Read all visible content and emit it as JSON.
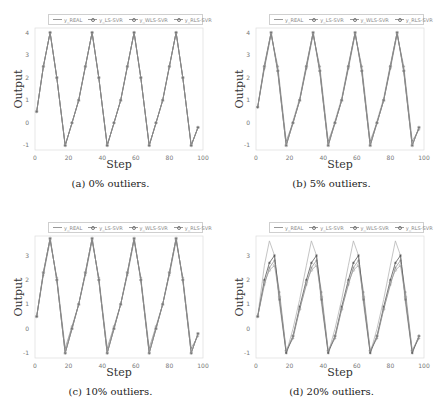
{
  "figure": {
    "panels": [
      {
        "id": "a",
        "caption": "(a) 0% outliers.",
        "xlabel": "Step",
        "ylabel": "Output",
        "yticks": [
          "4",
          "3",
          "2",
          "1",
          "0",
          "-1"
        ],
        "xticks": [
          "0",
          "20",
          "40",
          "60",
          "80",
          "100"
        ]
      },
      {
        "id": "b",
        "caption": "(b) 5% outliers.",
        "xlabel": "Step",
        "ylabel": "Output",
        "yticks": [
          "4",
          "3",
          "2",
          "1",
          "0",
          "-1"
        ],
        "xticks": [
          "0",
          "20",
          "40",
          "60",
          "80",
          "100"
        ]
      },
      {
        "id": "c",
        "caption": "(c) 10% outliers.",
        "xlabel": "Step",
        "ylabel": "Output",
        "yticks": [
          "3",
          "2",
          "1",
          "0",
          "-1"
        ],
        "xticks": [
          "0",
          "20",
          "40",
          "60",
          "80",
          "100"
        ]
      },
      {
        "id": "d",
        "caption": "(d) 20% outliers.",
        "xlabel": "Step",
        "ylabel": "Output",
        "yticks": [
          "3",
          "2",
          "1",
          "0",
          "-1"
        ],
        "xticks": [
          "0",
          "20",
          "40",
          "60",
          "80",
          "100"
        ]
      }
    ],
    "legend": [
      "y_REAL",
      "y_LS-SVR",
      "y_WLS-SVR",
      "y_RLS-SVR"
    ]
  },
  "chart_data": [
    {
      "type": "line",
      "title": "(a) 0% outliers.",
      "xlabel": "Step",
      "ylabel": "Output",
      "xlim": [
        0,
        100
      ],
      "ylim": [
        -1.2,
        4.2
      ],
      "legend": [
        "y_REAL",
        "y_LS-SVR",
        "y_WLS-SVR",
        "y_RLS-SVR"
      ],
      "x": [
        1,
        5,
        9,
        13,
        18,
        22,
        26,
        30,
        34,
        38,
        43,
        47,
        51,
        55,
        59,
        63,
        68,
        72,
        76,
        80,
        84,
        88,
        93,
        97
      ],
      "series": [
        {
          "name": "y_REAL",
          "values": [
            0.5,
            2.5,
            4.0,
            2.0,
            -1.0,
            0.0,
            1.0,
            2.5,
            4.0,
            2.0,
            -1.0,
            0.0,
            1.0,
            2.5,
            4.0,
            2.0,
            -1.0,
            0.0,
            1.0,
            2.5,
            4.0,
            2.0,
            -1.0,
            -0.2
          ]
        },
        {
          "name": "y_LS-SVR",
          "values": [
            0.5,
            2.5,
            4.0,
            2.0,
            -1.0,
            0.0,
            1.0,
            2.5,
            4.0,
            2.0,
            -1.0,
            0.0,
            1.0,
            2.5,
            4.0,
            2.0,
            -1.0,
            0.0,
            1.0,
            2.5,
            4.0,
            2.0,
            -1.0,
            -0.2
          ]
        },
        {
          "name": "y_WLS-SVR",
          "values": [
            0.5,
            2.5,
            4.0,
            2.0,
            -1.0,
            0.0,
            1.0,
            2.5,
            4.0,
            2.0,
            -1.0,
            0.0,
            1.0,
            2.5,
            4.0,
            2.0,
            -1.0,
            0.0,
            1.0,
            2.5,
            4.0,
            2.0,
            -1.0,
            -0.2
          ]
        },
        {
          "name": "y_RLS-SVR",
          "values": [
            0.5,
            2.5,
            4.0,
            2.0,
            -1.0,
            0.0,
            1.0,
            2.5,
            4.0,
            2.0,
            -1.0,
            0.0,
            1.0,
            2.5,
            4.0,
            2.0,
            -1.0,
            0.0,
            1.0,
            2.5,
            4.0,
            2.0,
            -1.0,
            -0.2
          ]
        }
      ]
    },
    {
      "type": "line",
      "title": "(b) 5% outliers.",
      "xlabel": "Step",
      "ylabel": "Output",
      "xlim": [
        0,
        100
      ],
      "ylim": [
        -1.2,
        4.2
      ],
      "legend": [
        "y_REAL",
        "y_LS-SVR",
        "y_WLS-SVR",
        "y_RLS-SVR"
      ],
      "x": [
        1,
        5,
        9,
        13,
        18,
        22,
        26,
        30,
        34,
        38,
        43,
        47,
        51,
        55,
        59,
        63,
        68,
        72,
        76,
        80,
        84,
        88,
        93,
        97
      ],
      "series": [
        {
          "name": "y_REAL",
          "values": [
            0.7,
            2.6,
            4.0,
            2.2,
            -1.0,
            0.1,
            1.1,
            2.6,
            4.0,
            2.2,
            -1.0,
            0.1,
            1.1,
            2.6,
            4.0,
            2.2,
            -1.0,
            0.1,
            1.1,
            2.6,
            4.0,
            2.2,
            -1.0,
            -0.2
          ]
        },
        {
          "name": "y_LS-SVR",
          "values": [
            0.7,
            2.4,
            3.9,
            2.5,
            -0.8,
            0.0,
            1.0,
            2.4,
            3.9,
            2.5,
            -0.8,
            0.0,
            1.0,
            2.4,
            3.9,
            2.5,
            -0.8,
            0.0,
            1.0,
            2.4,
            3.9,
            2.5,
            -0.8,
            -0.3
          ]
        },
        {
          "name": "y_WLS-SVR",
          "values": [
            0.7,
            2.5,
            4.0,
            2.3,
            -1.0,
            0.0,
            1.0,
            2.5,
            4.0,
            2.3,
            -1.0,
            0.0,
            1.0,
            2.5,
            4.0,
            2.3,
            -1.0,
            0.0,
            1.0,
            2.5,
            4.0,
            2.3,
            -1.0,
            -0.2
          ]
        },
        {
          "name": "y_RLS-SVR",
          "values": [
            0.7,
            2.5,
            4.0,
            2.3,
            -1.0,
            0.0,
            1.0,
            2.5,
            4.0,
            2.3,
            -1.0,
            0.0,
            1.0,
            2.5,
            4.0,
            2.3,
            -1.0,
            0.0,
            1.0,
            2.5,
            4.0,
            2.3,
            -1.0,
            -0.2
          ]
        }
      ]
    },
    {
      "type": "line",
      "title": "(c) 10% outliers.",
      "xlabel": "Step",
      "ylabel": "Output",
      "xlim": [
        0,
        100
      ],
      "ylim": [
        -1.2,
        3.8
      ],
      "legend": [
        "y_REAL",
        "y_LS-SVR",
        "y_WLS-SVR",
        "y_RLS-SVR"
      ],
      "x": [
        1,
        5,
        9,
        13,
        18,
        22,
        26,
        30,
        34,
        38,
        43,
        47,
        51,
        55,
        59,
        63,
        68,
        72,
        76,
        80,
        84,
        88,
        93,
        97
      ],
      "series": [
        {
          "name": "y_REAL",
          "values": [
            0.5,
            2.3,
            3.7,
            2.0,
            -1.0,
            0.0,
            1.0,
            2.3,
            3.7,
            2.0,
            -1.0,
            0.0,
            1.0,
            2.3,
            3.7,
            2.0,
            -1.0,
            0.0,
            1.0,
            2.3,
            3.7,
            2.0,
            -1.0,
            -0.2
          ]
        },
        {
          "name": "y_LS-SVR",
          "values": [
            0.5,
            2.2,
            3.6,
            2.1,
            -0.8,
            0.1,
            1.0,
            2.2,
            3.6,
            2.1,
            -0.8,
            0.1,
            1.0,
            2.2,
            3.6,
            2.1,
            -0.8,
            0.1,
            1.0,
            2.2,
            3.6,
            2.1,
            -0.8,
            -0.3
          ]
        },
        {
          "name": "y_WLS-SVR",
          "values": [
            0.5,
            2.3,
            3.7,
            2.0,
            -1.0,
            0.0,
            1.0,
            2.3,
            3.7,
            2.0,
            -1.0,
            0.0,
            1.0,
            2.3,
            3.7,
            2.0,
            -1.0,
            0.0,
            1.0,
            2.3,
            3.7,
            2.0,
            -1.0,
            -0.2
          ]
        },
        {
          "name": "y_RLS-SVR",
          "values": [
            0.5,
            2.3,
            3.7,
            2.0,
            -1.0,
            0.0,
            1.0,
            2.3,
            3.7,
            2.0,
            -1.0,
            0.0,
            1.0,
            2.3,
            3.7,
            2.0,
            -1.0,
            0.0,
            1.0,
            2.3,
            3.7,
            2.0,
            -1.0,
            -0.2
          ]
        }
      ]
    },
    {
      "type": "line",
      "title": "(d) 20% outliers.",
      "xlabel": "Step",
      "ylabel": "Output",
      "xlim": [
        0,
        100
      ],
      "ylim": [
        -1.2,
        3.8
      ],
      "legend": [
        "y_REAL",
        "y_LS-SVR",
        "y_WLS-SVR",
        "y_RLS-SVR"
      ],
      "x": [
        1,
        5,
        8,
        11,
        14,
        18,
        22,
        26,
        30,
        33,
        36,
        39,
        43,
        47,
        51,
        55,
        58,
        61,
        64,
        68,
        72,
        76,
        80,
        83,
        86,
        89,
        93,
        97
      ],
      "series": [
        {
          "name": "y_REAL",
          "values": [
            0.5,
            2.6,
            3.6,
            3.0,
            1.0,
            -1.0,
            0.0,
            1.2,
            2.6,
            3.6,
            3.0,
            1.0,
            -1.0,
            0.0,
            1.2,
            2.6,
            3.6,
            3.0,
            1.0,
            -1.0,
            0.0,
            1.2,
            2.6,
            3.6,
            3.0,
            1.0,
            -1.0,
            -0.3
          ]
        },
        {
          "name": "y_LS-SVR",
          "values": [
            0.5,
            1.8,
            2.5,
            2.8,
            1.5,
            -0.9,
            -0.4,
            0.8,
            1.8,
            2.5,
            2.8,
            1.5,
            -0.9,
            -0.4,
            0.8,
            1.8,
            2.5,
            2.8,
            1.5,
            -0.9,
            -0.4,
            0.8,
            1.8,
            2.5,
            2.8,
            1.5,
            -0.9,
            -0.4
          ]
        },
        {
          "name": "y_WLS-SVR",
          "values": [
            0.5,
            2.0,
            2.7,
            3.0,
            1.2,
            -1.0,
            -0.3,
            0.9,
            2.0,
            2.7,
            3.0,
            1.2,
            -1.0,
            -0.3,
            0.9,
            2.0,
            2.7,
            3.0,
            1.2,
            -1.0,
            -0.3,
            0.9,
            2.0,
            2.7,
            3.0,
            1.2,
            -1.0,
            -0.3
          ]
        },
        {
          "name": "y_RLS-SVR",
          "values": [
            0.5,
            1.9,
            2.4,
            2.6,
            1.3,
            -0.9,
            -0.3,
            0.8,
            1.9,
            2.4,
            2.6,
            1.3,
            -0.9,
            -0.3,
            0.8,
            1.9,
            2.4,
            2.6,
            1.3,
            -0.9,
            -0.3,
            0.8,
            1.9,
            2.4,
            2.6,
            1.3,
            -0.9,
            -0.3
          ]
        }
      ]
    }
  ]
}
